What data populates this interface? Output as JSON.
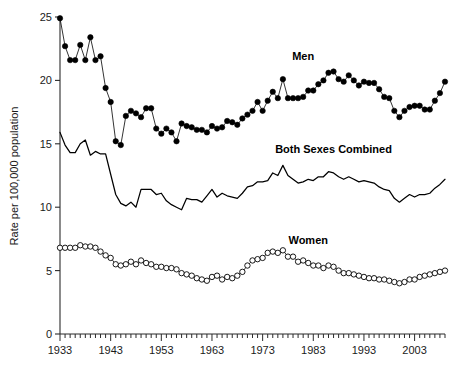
{
  "chart_data": {
    "type": "line",
    "title": "",
    "xlabel": "",
    "ylabel": "Rate per 100,000 population",
    "xlim": [
      1933,
      2009
    ],
    "ylim": [
      0,
      25
    ],
    "yticks": [
      0,
      5,
      10,
      15,
      20,
      25
    ],
    "xticks_labeled": [
      1933,
      1943,
      1953,
      1963,
      1973,
      1983,
      1993,
      2003
    ],
    "xtick_interval_minor": 1,
    "grid": false,
    "legend_position": "inline-annotations",
    "annotations": [
      {
        "text": "Men",
        "x": 1981,
        "y": 21.6
      },
      {
        "text": "Both Sexes Combined",
        "x": 1987,
        "y": 14.3
      },
      {
        "text": "Women",
        "x": 1982,
        "y": 7.1
      }
    ],
    "x": [
      1933,
      1934,
      1935,
      1936,
      1937,
      1938,
      1939,
      1940,
      1941,
      1942,
      1943,
      1944,
      1945,
      1946,
      1947,
      1948,
      1949,
      1950,
      1951,
      1952,
      1953,
      1954,
      1955,
      1956,
      1957,
      1958,
      1959,
      1960,
      1961,
      1962,
      1963,
      1964,
      1965,
      1966,
      1967,
      1968,
      1969,
      1970,
      1971,
      1972,
      1973,
      1974,
      1975,
      1976,
      1977,
      1978,
      1979,
      1980,
      1981,
      1982,
      1983,
      1984,
      1985,
      1986,
      1987,
      1988,
      1989,
      1990,
      1991,
      1992,
      1993,
      1994,
      1995,
      1996,
      1997,
      1998,
      1999,
      2000,
      2001,
      2002,
      2003,
      2004,
      2005,
      2006,
      2007,
      2008,
      2009
    ],
    "series": [
      {
        "name": "Men",
        "marker": "filled-circle",
        "color": "#000000",
        "values": [
          24.9,
          22.7,
          21.6,
          21.6,
          22.8,
          21.6,
          23.4,
          21.6,
          21.9,
          19.4,
          18.3,
          15.2,
          14.9,
          17.2,
          17.6,
          17.4,
          17.1,
          17.8,
          17.8,
          16.2,
          15.8,
          16.2,
          15.9,
          15.2,
          16.6,
          16.4,
          16.3,
          16.1,
          16.1,
          15.9,
          16.4,
          16.2,
          16.3,
          16.8,
          16.7,
          16.5,
          17.0,
          17.3,
          17.6,
          18.3,
          17.6,
          18.4,
          19.1,
          18.6,
          20.1,
          18.6,
          18.6,
          18.6,
          18.7,
          19.2,
          19.2,
          19.7,
          20.0,
          20.6,
          20.7,
          20.1,
          19.9,
          20.4,
          20.0,
          19.6,
          19.9,
          19.8,
          19.8,
          19.3,
          18.7,
          18.6,
          17.6,
          17.1,
          17.6,
          17.9,
          18.0,
          18.0,
          17.7,
          17.7,
          18.4,
          19.0,
          19.9
        ]
      },
      {
        "name": "Both Sexes Combined",
        "marker": "none",
        "color": "#000000",
        "values": [
          15.9,
          14.9,
          14.3,
          14.3,
          15.0,
          15.3,
          14.1,
          14.4,
          14.2,
          14.2,
          12.6,
          11.0,
          10.3,
          10.1,
          10.4,
          10.0,
          11.4,
          11.4,
          11.4,
          11.0,
          11.1,
          10.5,
          10.2,
          10.0,
          9.8,
          10.7,
          10.6,
          10.6,
          10.4,
          10.9,
          11.4,
          10.8,
          11.1,
          10.9,
          10.8,
          10.7,
          11.1,
          11.6,
          11.7,
          12.0,
          12.0,
          12.1,
          12.7,
          12.5,
          13.3,
          12.5,
          12.2,
          11.9,
          12.0,
          12.2,
          12.1,
          12.4,
          12.4,
          12.8,
          12.7,
          12.4,
          12.2,
          12.4,
          12.2,
          12.0,
          12.1,
          12.0,
          11.9,
          11.6,
          11.4,
          11.3,
          10.7,
          10.4,
          10.7,
          11.0,
          10.8,
          11.0,
          11.0,
          11.1,
          11.5,
          11.8,
          12.2
        ]
      },
      {
        "name": "Women",
        "marker": "open-circle",
        "color": "#000000",
        "values": [
          6.8,
          6.8,
          6.8,
          6.8,
          7.0,
          6.9,
          6.9,
          6.8,
          6.5,
          6.2,
          6.0,
          5.5,
          5.4,
          5.5,
          5.7,
          5.5,
          5.8,
          5.6,
          5.5,
          5.3,
          5.3,
          5.2,
          5.2,
          5.1,
          4.8,
          4.7,
          4.6,
          4.4,
          4.3,
          4.2,
          4.5,
          4.6,
          4.3,
          4.5,
          4.4,
          4.6,
          4.9,
          5.4,
          5.8,
          5.9,
          6.0,
          6.4,
          6.5,
          6.4,
          6.6,
          6.1,
          6.1,
          5.7,
          5.8,
          5.6,
          5.4,
          5.4,
          5.2,
          5.4,
          5.3,
          5.0,
          4.8,
          4.8,
          4.7,
          4.6,
          4.5,
          4.4,
          4.4,
          4.3,
          4.3,
          4.2,
          4.1,
          4.0,
          4.1,
          4.3,
          4.3,
          4.5,
          4.6,
          4.7,
          4.8,
          4.9,
          5.0
        ]
      }
    ]
  }
}
